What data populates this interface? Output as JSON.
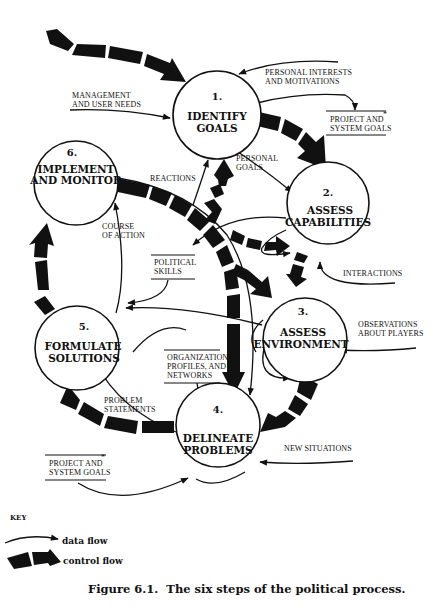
{
  "figure": {
    "caption": "Figure 6.1.  The six steps of the political process."
  },
  "nodes": [
    {
      "id": 1,
      "num": "1.",
      "line1": "IDENTIFY",
      "line2": "GOALS"
    },
    {
      "id": 2,
      "num": "2.",
      "line1": "ASSESS",
      "line2": "CAPABILITIES"
    },
    {
      "id": 3,
      "num": "3.",
      "line1": "ASSESS",
      "line2": "ENVIRONMENT"
    },
    {
      "id": 4,
      "num": "4.",
      "line1": "DELINEATE",
      "line2": "PROBLEMS"
    },
    {
      "id": 5,
      "num": "5.",
      "line1": "FORMULATE",
      "line2": "SOLUTIONS"
    },
    {
      "id": 6,
      "num": "6.",
      "line1": "IMPLEMENT",
      "line2": "AND MONITOR"
    }
  ],
  "labels": {
    "management_needs": [
      "MANAGEMENT",
      "AND USER NEEDS"
    ],
    "personal_interests": [
      "PERSONAL INTERESTS",
      "AND MOTIVATIONS"
    ],
    "project_goals_top": [
      "PROJECT AND",
      "SYSTEM GOALS"
    ],
    "project_goals_bottom": [
      "PROJECT AND",
      "SYSTEM GOALS"
    ],
    "asterisk": "*",
    "personal_goals": [
      "PERSONAL",
      "GOALS"
    ],
    "reactions": "REACTIONS",
    "course_of_action": [
      "COURSE",
      "OF ACTION"
    ],
    "political_skills": [
      "POLITICAL",
      "SKILLS"
    ],
    "interactions": "INTERACTIONS",
    "observations": [
      "OBSERVATIONS",
      "ABOUT PLAYERS"
    ],
    "organization": [
      "ORGANIZATION,",
      "PROFILES, AND",
      "NETWORKS"
    ],
    "problem_statements": [
      "PROBLEM",
      "STATEMENTS"
    ],
    "new_situations": "NEW SITUATIONS"
  },
  "key": {
    "heading": "KEY",
    "data_flow": "data flow",
    "control_flow": "control flow"
  }
}
